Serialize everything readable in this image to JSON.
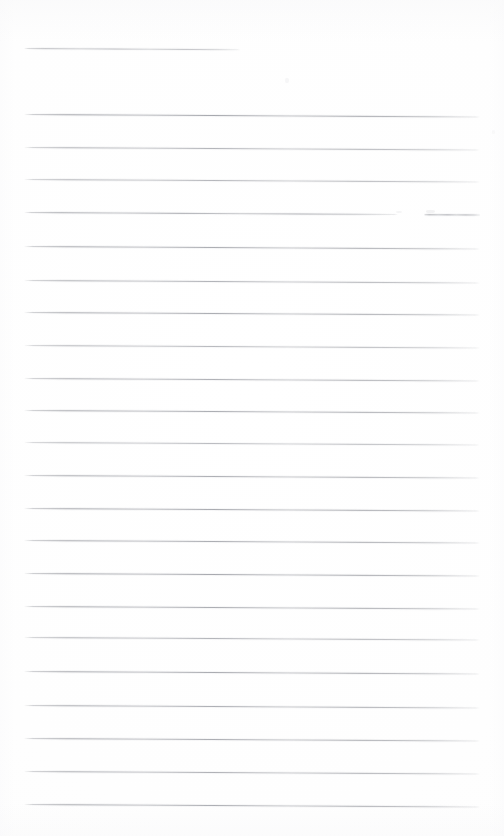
{
  "document": {
    "kind": "scanned-ruled-paper",
    "title": "Blank ruled page",
    "content_text": "",
    "page_width": 504,
    "page_height": 836,
    "background_color": "#ffffff",
    "rule_color": "#8a8c93",
    "rule_thickness": 1,
    "scan_skew_degrees": 0.32,
    "margin_left": 24,
    "margin_right": 480,
    "line_spacing": 32.7,
    "line_count": 24
  },
  "rules": [
    {
      "id": "rule-01",
      "y": 48,
      "x_start": 24,
      "x_end": 240,
      "kind": "header-rule",
      "opacity": 0.62,
      "gap": null
    },
    {
      "id": "rule-02",
      "y": 114,
      "x_start": 24,
      "x_end": 480,
      "kind": "body-rule",
      "opacity": 0.85,
      "gap": null
    },
    {
      "id": "rule-03",
      "y": 147,
      "x_start": 24,
      "x_end": 480,
      "kind": "body-rule",
      "opacity": 0.72,
      "gap": null
    },
    {
      "id": "rule-04",
      "y": 179,
      "x_start": 24,
      "x_end": 480,
      "kind": "body-rule",
      "opacity": 0.7,
      "gap": null
    },
    {
      "id": "rule-05",
      "y": 212,
      "x_start": 24,
      "x_end": 480,
      "kind": "body-rule",
      "opacity": 0.78,
      "gap": {
        "from": 398,
        "to": 424
      }
    },
    {
      "id": "rule-06",
      "y": 246,
      "x_start": 24,
      "x_end": 480,
      "kind": "body-rule",
      "opacity": 0.8,
      "gap": null
    },
    {
      "id": "rule-07",
      "y": 280,
      "x_start": 24,
      "x_end": 480,
      "kind": "body-rule",
      "opacity": 0.74,
      "gap": null
    },
    {
      "id": "rule-08",
      "y": 312,
      "x_start": 24,
      "x_end": 480,
      "kind": "body-rule",
      "opacity": 0.8,
      "gap": null
    },
    {
      "id": "rule-09",
      "y": 345,
      "x_start": 24,
      "x_end": 480,
      "kind": "body-rule",
      "opacity": 0.68,
      "gap": null
    },
    {
      "id": "rule-10",
      "y": 378,
      "x_start": 24,
      "x_end": 480,
      "kind": "body-rule",
      "opacity": 0.76,
      "gap": null
    },
    {
      "id": "rule-11",
      "y": 410,
      "x_start": 24,
      "x_end": 480,
      "kind": "body-rule",
      "opacity": 0.8,
      "gap": null
    },
    {
      "id": "rule-12",
      "y": 442,
      "x_start": 24,
      "x_end": 480,
      "kind": "body-rule",
      "opacity": 0.66,
      "gap": null
    },
    {
      "id": "rule-13",
      "y": 475,
      "x_start": 24,
      "x_end": 480,
      "kind": "body-rule",
      "opacity": 0.78,
      "gap": null
    },
    {
      "id": "rule-14",
      "y": 508,
      "x_start": 24,
      "x_end": 480,
      "kind": "body-rule",
      "opacity": 0.82,
      "gap": null
    },
    {
      "id": "rule-15",
      "y": 540,
      "x_start": 24,
      "x_end": 480,
      "kind": "body-rule",
      "opacity": 0.8,
      "gap": null
    },
    {
      "id": "rule-16",
      "y": 573,
      "x_start": 24,
      "x_end": 480,
      "kind": "body-rule",
      "opacity": 0.84,
      "gap": null
    },
    {
      "id": "rule-17",
      "y": 606,
      "x_start": 24,
      "x_end": 480,
      "kind": "body-rule",
      "opacity": 0.8,
      "gap": null
    },
    {
      "id": "rule-18",
      "y": 637,
      "x_start": 24,
      "x_end": 480,
      "kind": "body-rule",
      "opacity": 0.72,
      "gap": null
    },
    {
      "id": "rule-19",
      "y": 671,
      "x_start": 24,
      "x_end": 480,
      "kind": "body-rule",
      "opacity": 0.82,
      "gap": null
    },
    {
      "id": "rule-20",
      "y": 705,
      "x_start": 24,
      "x_end": 480,
      "kind": "body-rule",
      "opacity": 0.78,
      "gap": null
    },
    {
      "id": "rule-21",
      "y": 738,
      "x_start": 24,
      "x_end": 480,
      "kind": "body-rule",
      "opacity": 0.8,
      "gap": null
    },
    {
      "id": "rule-22",
      "y": 771,
      "x_start": 24,
      "x_end": 480,
      "kind": "body-rule",
      "opacity": 0.76,
      "gap": null
    },
    {
      "id": "rule-23",
      "y": 804,
      "x_start": 24,
      "x_end": 480,
      "kind": "body-rule",
      "opacity": 0.82,
      "gap": null
    }
  ],
  "artifacts": [
    {
      "id": "speck-1",
      "x": 285,
      "y": 78,
      "w": 4,
      "h": 5,
      "opacity": 0.3
    },
    {
      "id": "speck-2",
      "x": 396,
      "y": 211,
      "w": 6,
      "h": 2,
      "opacity": 0.35
    },
    {
      "id": "speck-3",
      "x": 426,
      "y": 210,
      "w": 9,
      "h": 3,
      "opacity": 0.45
    },
    {
      "id": "speck-4",
      "x": 492,
      "y": 130,
      "w": 3,
      "h": 4,
      "opacity": 0.22
    }
  ]
}
